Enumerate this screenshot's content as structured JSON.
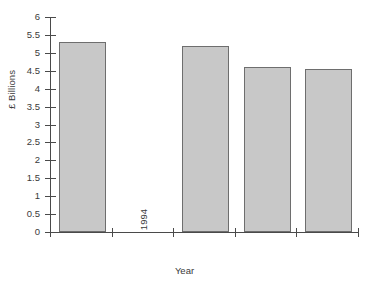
{
  "chart_data": {
    "type": "bar",
    "title": "",
    "subtitle": "",
    "xlabel": "Year",
    "ylabel": "£ Billions",
    "categories": [
      "1993",
      "1994",
      "1995",
      "1996",
      "1997"
    ],
    "values": [
      5.3,
      0,
      5.2,
      4.6,
      4.55
    ],
    "series": [
      {
        "name": "",
        "values": [
          5.3,
          0,
          5.2,
          4.6,
          4.55
        ]
      }
    ],
    "ylim": [
      0,
      6
    ],
    "y_ticks": [
      "0",
      "0.5",
      "1",
      "1.5",
      "2",
      "2.5",
      "3",
      "3.5",
      "4",
      "4.5",
      "5",
      "5.5",
      "6"
    ],
    "y_tick_values": [
      0,
      0.5,
      1,
      1.5,
      2,
      2.5,
      3,
      3.5,
      4,
      4.5,
      5,
      5.5,
      6
    ],
    "grid": false,
    "legend": false,
    "legend_position": "none",
    "bar_fill_color": "#c8c8c8",
    "bar_border_color": "#6e6e6e",
    "axis_color": "#4a4a4a",
    "background_color": "#ffffff",
    "x_tick_label_rotation": 90,
    "annotations": []
  }
}
